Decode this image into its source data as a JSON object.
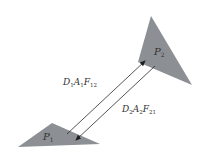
{
  "diagram": {
    "type": "radiation exchange between two surfaces",
    "colors": {
      "background": "#ffffff",
      "surface_fill": "#8c8f93",
      "arrow_stroke": "#2a2a2a",
      "text": "#333333"
    },
    "surfaces": [
      {
        "id": "P1",
        "label_main": "P",
        "label_sub": "1",
        "points": "18,147 52,123 100,144",
        "label_x": 43,
        "label_y": 140
      },
      {
        "id": "P2",
        "label_main": "P",
        "label_sub": "2",
        "points": "151,16 192,85 138,62",
        "label_x": 154,
        "label_y": 55
      }
    ],
    "flows": [
      {
        "id": "flow-1-to-2",
        "label": "D1A1F12",
        "parts": [
          {
            "t": "D",
            "s": "1"
          },
          {
            "t": "A",
            "s": "1"
          },
          {
            "t": "F",
            "s": "12"
          }
        ],
        "from": [
          67,
          134
        ],
        "to": [
          145,
          61
        ],
        "label_x": 63,
        "label_y": 85
      },
      {
        "id": "flow-2-to-1",
        "label": "D2A2F21",
        "parts": [
          {
            "t": "D",
            "s": "2"
          },
          {
            "t": "A",
            "s": "2"
          },
          {
            "t": "F",
            "s": "21"
          }
        ],
        "from": [
          155,
          66
        ],
        "to": [
          76,
          140
        ],
        "label_x": 122,
        "label_y": 112
      }
    ]
  }
}
